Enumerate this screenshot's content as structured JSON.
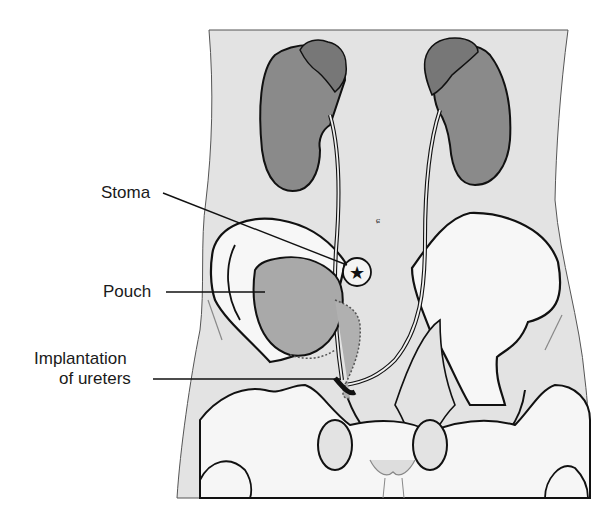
{
  "figure": {
    "labels": [
      {
        "id": "stoma",
        "text": "Stoma"
      },
      {
        "id": "pouch",
        "text": "Pouch"
      },
      {
        "id": "implantation_line1",
        "text": "Implantation"
      },
      {
        "id": "implantation_line2",
        "text": "of ureters"
      }
    ],
    "colors": {
      "body_fill": "#e3e3e3",
      "kidney_fill": "#8a8a8a",
      "pouch_fill": "#a9a9a9",
      "bone_fill": "#f4f4f4",
      "outline": "#111111",
      "background": "#ffffff"
    },
    "umbilicus_glyph": "ɕ"
  }
}
